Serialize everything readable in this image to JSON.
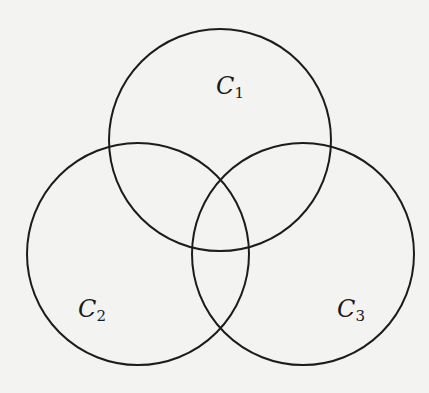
{
  "diagram": {
    "type": "venn",
    "circles": [
      {
        "id": "C1",
        "name": "C",
        "subscript": "1",
        "cx": 220,
        "cy": 140,
        "r": 111,
        "label_x": 216,
        "label_y": 74
      },
      {
        "id": "C2",
        "name": "C",
        "subscript": "2",
        "cx": 138,
        "cy": 254,
        "r": 111,
        "label_x": 78,
        "label_y": 297
      },
      {
        "id": "C3",
        "name": "C",
        "subscript": "3",
        "cx": 303,
        "cy": 254,
        "r": 111,
        "label_x": 337,
        "label_y": 297
      }
    ],
    "stroke_color": "#1c1c1c",
    "background_color": "#f3f3f1"
  }
}
